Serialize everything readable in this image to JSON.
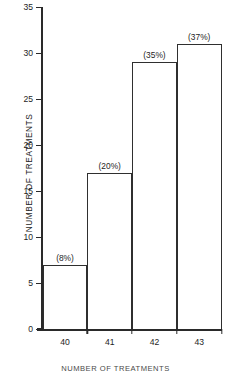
{
  "chart_data": {
    "type": "bar",
    "title": "",
    "xlabel": "",
    "ylabel": "NUMBER  OF  TREATMENTS",
    "categories": [
      "40",
      "41",
      "42",
      "43"
    ],
    "values": [
      7,
      17,
      29,
      31
    ],
    "data_labels": [
      "(8%)",
      "(20%)",
      "(35%)",
      "(37%)"
    ],
    "ylim": [
      0,
      35
    ],
    "ytick_labels": [
      "0",
      "5",
      "10",
      "15",
      "20",
      "25",
      "30",
      "35"
    ],
    "ytick_values": [
      0,
      5,
      10,
      15,
      20,
      25,
      30,
      35
    ],
    "grid": false,
    "legend": "none",
    "bar_fill": "#ffffff",
    "bar_edge_color": "#2f2f2f",
    "axis_color": "#2a2a2a"
  },
  "caption": {
    "text": "NUMBER OF TREATMENTS"
  }
}
